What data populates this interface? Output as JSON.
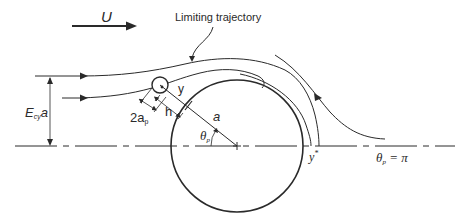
{
  "diagram": {
    "labels": {
      "velocity": "U",
      "limiting_trajectory": "Limiting trajectory",
      "capture_width_main": "E",
      "capture_width_sub": "cy",
      "capture_width_tail": "a",
      "particle_diameter_main": "2a",
      "particle_diameter_sub": "p",
      "gap": "h",
      "normal_coord": "y",
      "collector_radius": "a",
      "angle_main": "θ",
      "angle_sub": "p",
      "ystar_main": "y",
      "ystar_sup": "*",
      "theta_pi_main": "θ",
      "theta_pi_sub": "p",
      "theta_pi_tail": " = π"
    },
    "geometry": {
      "collector_center": [
        237,
        146
      ],
      "collector_radius_px": 66,
      "particle_center": [
        160,
        85
      ],
      "particle_radius_px": 8,
      "axis_y": 146
    },
    "colors": {
      "stroke": "#2a2a2a",
      "background": "#ffffff"
    }
  }
}
